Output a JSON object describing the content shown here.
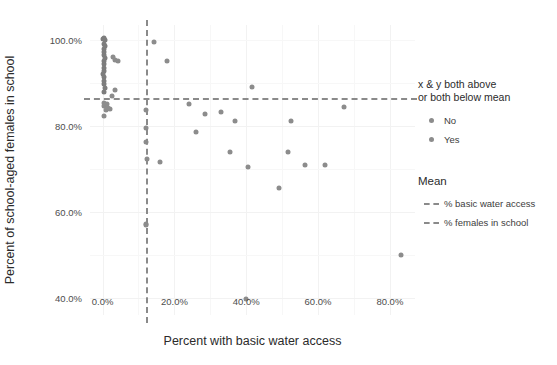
{
  "chart_data": {
    "type": "scatter",
    "title": "",
    "xlabel": "Percent with basic water access",
    "ylabel": "Percent of school-aged females in school",
    "xlim": [
      -3.5,
      87.0
    ],
    "ylim": [
      36.0,
      103.5
    ],
    "xticks": [
      0,
      20,
      40,
      60,
      80
    ],
    "xticklabels": [
      "0.0%",
      "20.0%",
      "40.0%",
      "60.0%",
      "80.0%"
    ],
    "yticks": [
      40,
      60,
      80,
      100
    ],
    "yticklabels": [
      "40.0%",
      "60.0%",
      "80.0%",
      "100.0%"
    ],
    "grid": true,
    "legend_position": "right",
    "legend_title": "x & y both above or both below mean",
    "mean_x": 12.0,
    "mean_y": 86.5,
    "point_color": "#8c8c8c",
    "mean_line_color": "#8a8a8a",
    "grid_color": "#f2f2f2",
    "series": [
      {
        "name": "No",
        "values": [
          [
            0.3,
            85.3
          ],
          [
            0.5,
            84.6
          ],
          [
            0.9,
            84.9
          ],
          [
            1.2,
            85.2
          ],
          [
            1.0,
            83.8
          ],
          [
            1.4,
            84.1
          ],
          [
            0.4,
            82.3
          ],
          [
            2.0,
            83.9
          ],
          [
            3.4,
            88.3
          ],
          [
            14.2,
            99.5
          ],
          [
            18.0,
            95.1
          ],
          [
            41.5,
            89.0
          ],
          [
            12.2,
            83.7
          ],
          [
            12.0,
            79.5
          ],
          [
            12.1,
            76.2
          ],
          [
            12.3,
            72.2
          ],
          [
            12.0,
            57.2
          ],
          [
            12.1,
            56.9
          ],
          [
            16.1,
            71.5
          ],
          [
            67.2,
            84.3
          ]
        ]
      },
      {
        "name": "Yes",
        "values": [
          [
            0.2,
            100.2
          ],
          [
            0.5,
            100.4
          ],
          [
            0.8,
            99.9
          ],
          [
            0.3,
            99.1
          ],
          [
            0.6,
            98.6
          ],
          [
            0.4,
            97.9
          ],
          [
            0.5,
            97.2
          ],
          [
            0.3,
            96.5
          ],
          [
            0.6,
            95.9
          ],
          [
            0.4,
            95.1
          ],
          [
            0.3,
            94.4
          ],
          [
            0.5,
            93.6
          ],
          [
            0.4,
            92.8
          ],
          [
            0.2,
            92.1
          ],
          [
            0.5,
            91.3
          ],
          [
            0.3,
            90.5
          ],
          [
            0.4,
            89.7
          ],
          [
            0.6,
            88.9
          ],
          [
            0.3,
            88.0
          ],
          [
            3.0,
            96.0
          ],
          [
            3.6,
            95.4
          ],
          [
            4.4,
            95.2
          ],
          [
            2.6,
            87.0
          ],
          [
            24.0,
            85.0
          ],
          [
            28.5,
            82.7
          ],
          [
            33.0,
            83.2
          ],
          [
            37.0,
            81.1
          ],
          [
            26.0,
            78.5
          ],
          [
            35.5,
            74.0
          ],
          [
            40.5,
            70.4
          ],
          [
            49.0,
            65.5
          ],
          [
            52.5,
            81.1
          ],
          [
            51.5,
            74.0
          ],
          [
            56.5,
            71.0
          ],
          [
            62.0,
            71.0
          ],
          [
            40.0,
            39.8
          ],
          [
            83.0,
            50.0
          ]
        ]
      }
    ],
    "mean_lines": [
      {
        "label": "% basic water access",
        "orientation": "vertical",
        "value": 12.0
      },
      {
        "label": "% females in school",
        "orientation": "horizontal",
        "value": 86.5
      }
    ]
  },
  "legend": {
    "group_title_line1": "x & y both above",
    "group_title_line2": "or both below mean",
    "categories": [
      {
        "label": "No"
      },
      {
        "label": "Yes"
      }
    ],
    "mean_title": "Mean",
    "mean_items": [
      {
        "label": "% basic water access"
      },
      {
        "label": "% females in school"
      }
    ]
  }
}
